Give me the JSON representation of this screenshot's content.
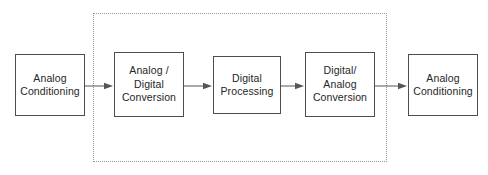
{
  "diagram": {
    "canvas": {
      "width": 488,
      "height": 175,
      "background": "#ffffff"
    },
    "colors": {
      "box_border": "#4d4d4d",
      "box_fill": "#ffffff",
      "text": "#262626",
      "edge": "#555555",
      "dotted_region_border": "#9a9a9a"
    },
    "region": {
      "name": "digital-domain-region",
      "style": "dotted",
      "x": 93,
      "y": 13,
      "width": 294,
      "height": 149,
      "label": ""
    },
    "nodes": [
      {
        "id": "analog-conditioning-input",
        "label": "Analog\nConditioning",
        "x": 15,
        "y": 54,
        "width": 70,
        "height": 62,
        "inside_region": false
      },
      {
        "id": "analog-digital-conversion",
        "label": "Analog /\nDigital\nConversion",
        "x": 114,
        "y": 52,
        "width": 70,
        "height": 65,
        "inside_region": true
      },
      {
        "id": "digital-processing",
        "label": "Digital\nProcessing",
        "x": 213,
        "y": 56,
        "width": 68,
        "height": 58,
        "inside_region": true
      },
      {
        "id": "digital-analog-conversion",
        "label": "Digital/\nAnalog\nConversion",
        "x": 305,
        "y": 52,
        "width": 70,
        "height": 65,
        "inside_region": true
      },
      {
        "id": "analog-conditioning-output",
        "label": "Analog\nConditioning",
        "x": 408,
        "y": 54,
        "width": 70,
        "height": 62,
        "inside_region": false
      }
    ],
    "edges": [
      {
        "id": "edge-1",
        "from": "analog-conditioning-input",
        "to": "analog-digital-conversion",
        "x1": 85,
        "x2": 113,
        "y": 86
      },
      {
        "id": "edge-2",
        "from": "analog-digital-conversion",
        "to": "digital-processing",
        "x1": 184,
        "x2": 212,
        "y": 86
      },
      {
        "id": "edge-3",
        "from": "digital-processing",
        "to": "digital-analog-conversion",
        "x1": 281,
        "x2": 304,
        "y": 86
      },
      {
        "id": "edge-4",
        "from": "digital-analog-conversion",
        "to": "analog-conditioning-output",
        "x1": 375,
        "x2": 407,
        "y": 86
      }
    ]
  }
}
